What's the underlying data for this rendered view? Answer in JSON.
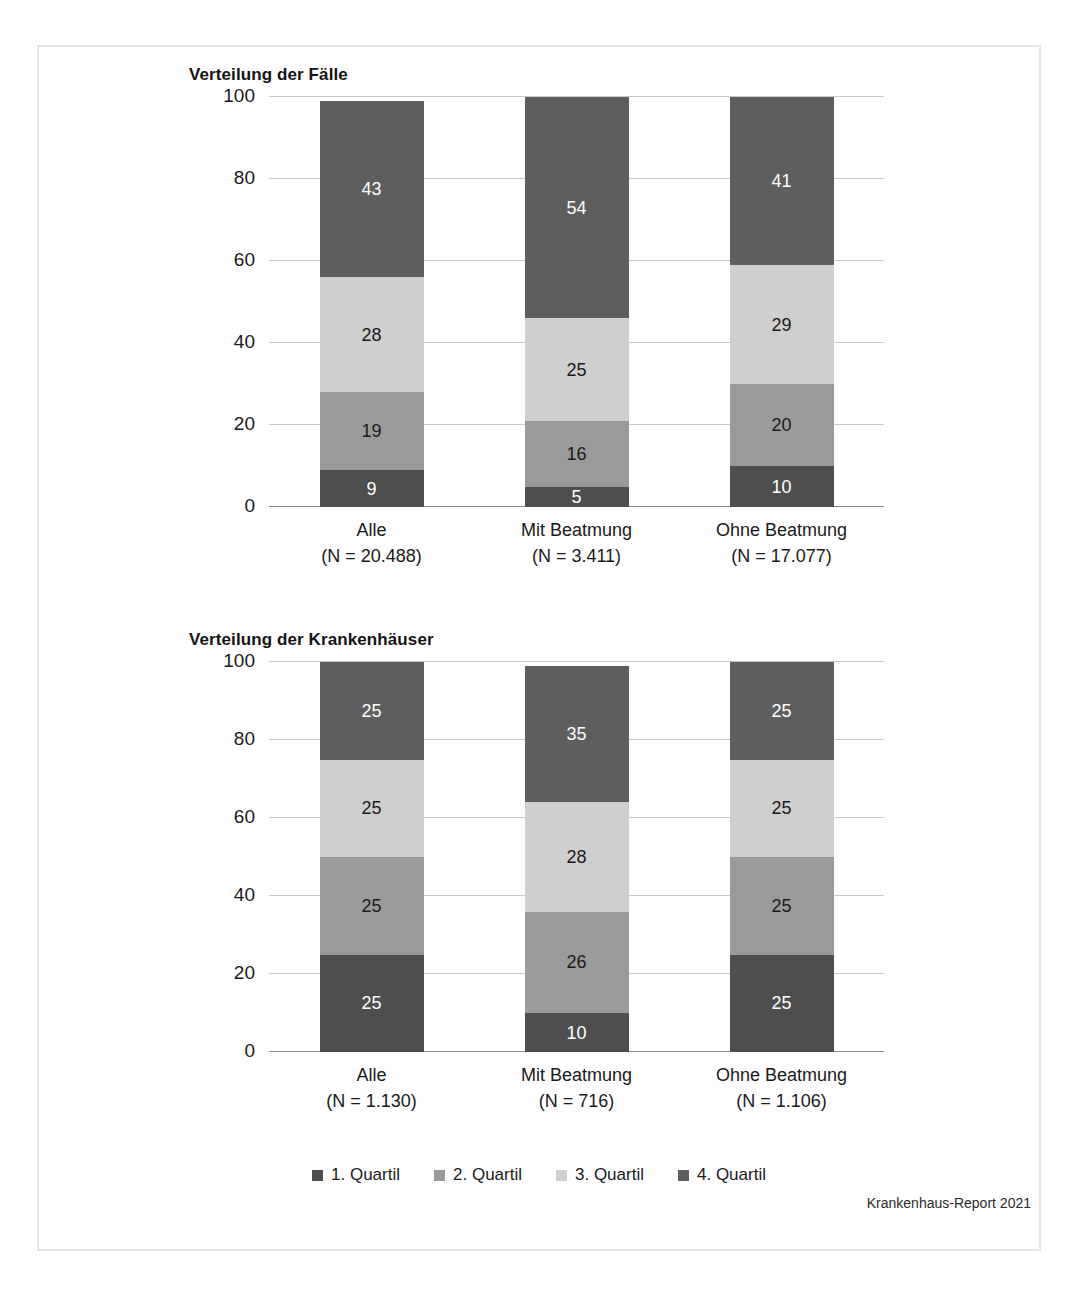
{
  "figure": {
    "source_note": "Krankenhaus-Report 2021"
  },
  "legend": {
    "items": [
      {
        "label": "1. Quartil",
        "color": "#4e4e4e",
        "key": "q1"
      },
      {
        "label": "2. Quartil",
        "color": "#9a9a9a",
        "key": "q2"
      },
      {
        "label": "3. Quartil",
        "color": "#cfcfcf",
        "key": "q3"
      },
      {
        "label": "4. Quartil",
        "color": "#5e5e5e",
        "key": "q4"
      }
    ]
  },
  "chart_data": [
    {
      "type": "bar",
      "subtype": "stacked-100-percent",
      "title": "Verteilung der Fälle",
      "xlabel": "",
      "ylabel": "",
      "ylim": [
        0,
        100
      ],
      "yticks": [
        0,
        20,
        40,
        60,
        80,
        100
      ],
      "grid": true,
      "legend_position": "bottom-shared",
      "categories": [
        "Alle",
        "Mit Beatmung",
        "Ohne Beatmung"
      ],
      "category_sublabels": [
        "(N = 20.488)",
        "(N = 3.411)",
        "(N = 17.077)"
      ],
      "series": [
        {
          "name": "1. Quartil",
          "color": "#4e4e4e",
          "values": [
            9,
            5,
            10
          ]
        },
        {
          "name": "2. Quartil",
          "color": "#9a9a9a",
          "values": [
            19,
            16,
            20
          ]
        },
        {
          "name": "3. Quartil",
          "color": "#cfcfcf",
          "values": [
            28,
            25,
            29
          ]
        },
        {
          "name": "4. Quartil",
          "color": "#5e5e5e",
          "values": [
            43,
            54,
            41
          ]
        }
      ]
    },
    {
      "type": "bar",
      "subtype": "stacked-100-percent",
      "title": "Verteilung der Krankenhäuser",
      "xlabel": "",
      "ylabel": "",
      "ylim": [
        0,
        100
      ],
      "yticks": [
        0,
        20,
        40,
        60,
        80,
        100
      ],
      "grid": true,
      "legend_position": "bottom-shared",
      "categories": [
        "Alle",
        "Mit Beatmung",
        "Ohne Beatmung"
      ],
      "category_sublabels": [
        "(N = 1.130)",
        "(N = 716)",
        "(N = 1.106)"
      ],
      "series": [
        {
          "name": "1. Quartil",
          "color": "#4e4e4e",
          "values": [
            25,
            10,
            25
          ]
        },
        {
          "name": "2. Quartil",
          "color": "#9a9a9a",
          "values": [
            25,
            26,
            25
          ]
        },
        {
          "name": "3. Quartil",
          "color": "#cfcfcf",
          "values": [
            25,
            28,
            25
          ]
        },
        {
          "name": "4. Quartil",
          "color": "#5e5e5e",
          "values": [
            25,
            35,
            25
          ]
        }
      ]
    }
  ]
}
